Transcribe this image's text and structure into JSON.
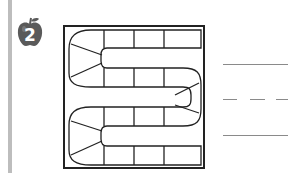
{
  "exercise": {
    "number": "2",
    "badge_shape": "apple-icon",
    "badge_color": "#5a5a5a"
  },
  "board": {
    "type": "serpentine-game-path",
    "rows": 4,
    "squares_per_straight": 3,
    "curve_segments": 3
  },
  "answer_lines": [
    {
      "style": "solid"
    },
    {
      "style": "dashed"
    },
    {
      "style": "solid"
    }
  ]
}
